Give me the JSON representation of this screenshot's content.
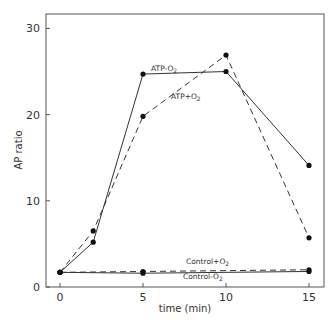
{
  "chart_data": {
    "type": "line",
    "title": "",
    "xlabel": "time (min)",
    "ylabel": "AP ratio",
    "xlim": [
      0,
      15
    ],
    "ylim": [
      0,
      30
    ],
    "xticks": [
      "0",
      "5",
      "10",
      "15"
    ],
    "yticks": [
      "0",
      "10",
      "20",
      "30"
    ],
    "grid": false,
    "series": [
      {
        "name": "ATP-O2",
        "label": "ATP-O",
        "sub": "2",
        "style": "solid",
        "x": [
          0,
          2,
          5,
          10,
          15
        ],
        "values": [
          1.7,
          5.2,
          24.7,
          25.0,
          14.1
        ]
      },
      {
        "name": "ATP+O2",
        "label": "ATP+O",
        "sub": "2",
        "style": "dashed",
        "x": [
          0,
          2,
          5,
          10,
          15
        ],
        "values": [
          1.7,
          6.5,
          19.8,
          26.9,
          5.7
        ]
      },
      {
        "name": "Control+O2",
        "label": "Control+O",
        "sub": "2",
        "style": "dashed",
        "x": [
          0,
          5,
          15
        ],
        "values": [
          1.7,
          1.8,
          2.0
        ]
      },
      {
        "name": "Control-O2",
        "label": "Control-O",
        "sub": "2",
        "style": "solid",
        "x": [
          0,
          5,
          15
        ],
        "values": [
          1.7,
          1.6,
          1.8
        ]
      }
    ]
  }
}
